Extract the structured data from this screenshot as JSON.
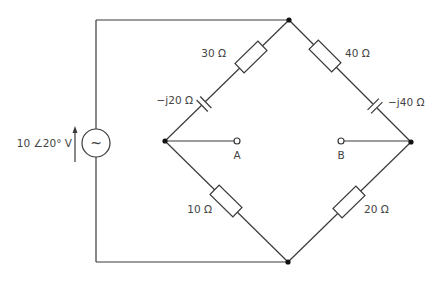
{
  "diagram": {
    "title": "",
    "source": {
      "label": "10 ∠20° V",
      "symbol": "~",
      "type": "ac-voltage-source"
    },
    "components": [
      {
        "id": "R1",
        "type": "resistor",
        "label": "30 Ω",
        "branch": "upper-left"
      },
      {
        "id": "C1",
        "type": "capacitor",
        "label": "−j20 Ω",
        "branch": "upper-left"
      },
      {
        "id": "R2",
        "type": "resistor",
        "label": "40 Ω",
        "branch": "upper-right"
      },
      {
        "id": "C2",
        "type": "capacitor",
        "label": "−j40 Ω",
        "branch": "upper-right"
      },
      {
        "id": "R3",
        "type": "resistor",
        "label": "10 Ω",
        "branch": "lower-left"
      },
      {
        "id": "R4",
        "type": "resistor",
        "label": "20 Ω",
        "branch": "lower-right"
      }
    ],
    "terminals": [
      {
        "id": "A",
        "label": "A"
      },
      {
        "id": "B",
        "label": "B"
      }
    ],
    "colors": {
      "wire": "#3a3a3a",
      "node": "#111111",
      "text": "#444444"
    }
  }
}
